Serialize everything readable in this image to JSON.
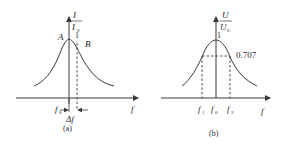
{
  "panel_a": {
    "caption": "(a)",
    "y_label_num": "I",
    "y_label_den": "I",
    "y_label_den_sub": "0",
    "peak_value": "1",
    "point_a": "A",
    "point_b": "B",
    "x_label": "f",
    "f0_label": "f",
    "f0_sub": "0",
    "delta_label": "Δf"
  },
  "panel_b": {
    "caption": "(b)",
    "y_label_num": "U",
    "y_label_den": "U",
    "y_label_den_sub": "0",
    "peak_value": "1",
    "level_label": "0.707",
    "x_label": "f",
    "ticks": [
      {
        "main": "f",
        "sub": "1"
      },
      {
        "main": "f",
        "sub": "0"
      },
      {
        "main": "f",
        "sub": "2"
      }
    ]
  },
  "colors": {
    "line": "#3a3a3a",
    "text": "#2a2a2a",
    "background": "#ffffff"
  }
}
